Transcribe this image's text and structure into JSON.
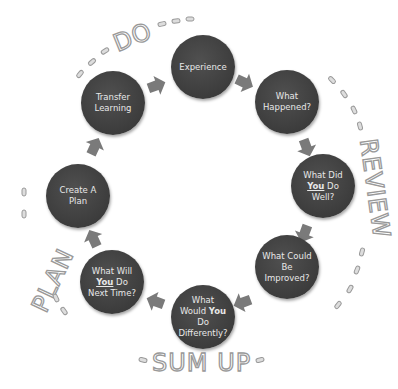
{
  "diagram": {
    "type": "cycle",
    "phase_labels": [
      {
        "id": "do",
        "text": "DO"
      },
      {
        "id": "review",
        "text": "REVIEW"
      },
      {
        "id": "sum_up",
        "text": "SUM UP"
      },
      {
        "id": "plan",
        "text": "PLAN"
      }
    ],
    "nodes": [
      {
        "id": "experience",
        "lines": [
          "Experience"
        ]
      },
      {
        "id": "what_happened",
        "lines": [
          "What",
          "Happened?"
        ]
      },
      {
        "id": "did_well",
        "lines": [
          "What Did",
          "You",
          "Do",
          "Well?"
        ],
        "emphasis": "You"
      },
      {
        "id": "improved",
        "lines": [
          "What Could",
          "Be",
          "Improved?"
        ]
      },
      {
        "id": "differently",
        "lines": [
          "What",
          "Would",
          "You",
          "Do",
          "Differently?"
        ],
        "emphasis": "You"
      },
      {
        "id": "next_time",
        "lines": [
          "What Will",
          "You",
          "Do",
          "Next Time?"
        ],
        "emphasis": "You"
      },
      {
        "id": "create_plan",
        "lines": [
          "Create A",
          "Plan"
        ]
      },
      {
        "id": "transfer",
        "lines": [
          "Transfer",
          "Learning"
        ]
      }
    ],
    "colors": {
      "node": "#444444",
      "node_text": "#e8e8e8",
      "arrow": "#7a7a7a",
      "label_outline": "#999999"
    }
  }
}
